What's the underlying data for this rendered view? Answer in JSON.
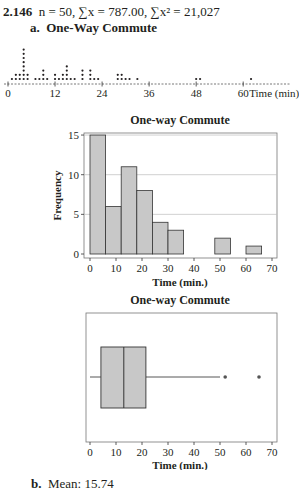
{
  "header": {
    "problem_number": "2.146",
    "summary": "n = 50, ∑x = 787.00, ∑x² = 21,027"
  },
  "part_a": {
    "label": "a.",
    "title": "One-Way Commute"
  },
  "part_b": {
    "label": "b.",
    "text": "Mean: 15.74"
  },
  "chart_data": [
    {
      "type": "scatter",
      "subtype": "dotplot",
      "title": "One-Way Commute",
      "xlabel": "Time (min)",
      "xticks": [
        0,
        12,
        24,
        36,
        48,
        60
      ],
      "xlim": [
        0,
        66
      ],
      "points": [
        {
          "x": 1,
          "count": 1
        },
        {
          "x": 2,
          "count": 2
        },
        {
          "x": 3,
          "count": 2
        },
        {
          "x": 4,
          "count": 8
        },
        {
          "x": 5,
          "count": 2
        },
        {
          "x": 7,
          "count": 1
        },
        {
          "x": 8,
          "count": 1
        },
        {
          "x": 9,
          "count": 3
        },
        {
          "x": 10,
          "count": 1
        },
        {
          "x": 12,
          "count": 2
        },
        {
          "x": 13,
          "count": 1
        },
        {
          "x": 14,
          "count": 2
        },
        {
          "x": 15,
          "count": 4
        },
        {
          "x": 16,
          "count": 1
        },
        {
          "x": 17,
          "count": 1
        },
        {
          "x": 19,
          "count": 3
        },
        {
          "x": 21,
          "count": 3
        },
        {
          "x": 22,
          "count": 1
        },
        {
          "x": 23,
          "count": 1
        },
        {
          "x": 28,
          "count": 2
        },
        {
          "x": 29,
          "count": 2
        },
        {
          "x": 30,
          "count": 1
        },
        {
          "x": 31,
          "count": 1
        },
        {
          "x": 33,
          "count": 1
        },
        {
          "x": 48,
          "count": 1
        },
        {
          "x": 49,
          "count": 1
        },
        {
          "x": 62,
          "count": 1
        }
      ]
    },
    {
      "type": "bar",
      "subtype": "histogram",
      "title": "One-way Commute",
      "xlabel": "Time (min.)",
      "ylabel": "Frequency",
      "bin_edges": [
        0,
        6,
        12,
        18,
        24,
        30,
        36,
        42,
        48,
        54,
        60,
        66
      ],
      "values": [
        15,
        6,
        11,
        8,
        4,
        3,
        0,
        0,
        2,
        0,
        1
      ],
      "xticks": [
        0,
        10,
        20,
        30,
        40,
        50,
        60,
        70
      ],
      "yticks": [
        0,
        5,
        10,
        15
      ],
      "xlim": [
        -2,
        72
      ],
      "ylim": [
        0,
        16
      ],
      "grid": "horizontal at y ticks",
      "bar_color": "#c8c8c8"
    },
    {
      "type": "box",
      "title": "One-way Commute",
      "xlabel": "Time (min.)",
      "xticks": [
        0,
        10,
        20,
        30,
        40,
        50,
        60,
        70
      ],
      "xlim": [
        -2,
        72
      ],
      "whisker_low": 0,
      "q1": 4.2,
      "median": 13,
      "q3": 21.5,
      "whisker_high": 50,
      "outliers": [
        52,
        65
      ],
      "box_color": "#c8c8c8"
    }
  ]
}
